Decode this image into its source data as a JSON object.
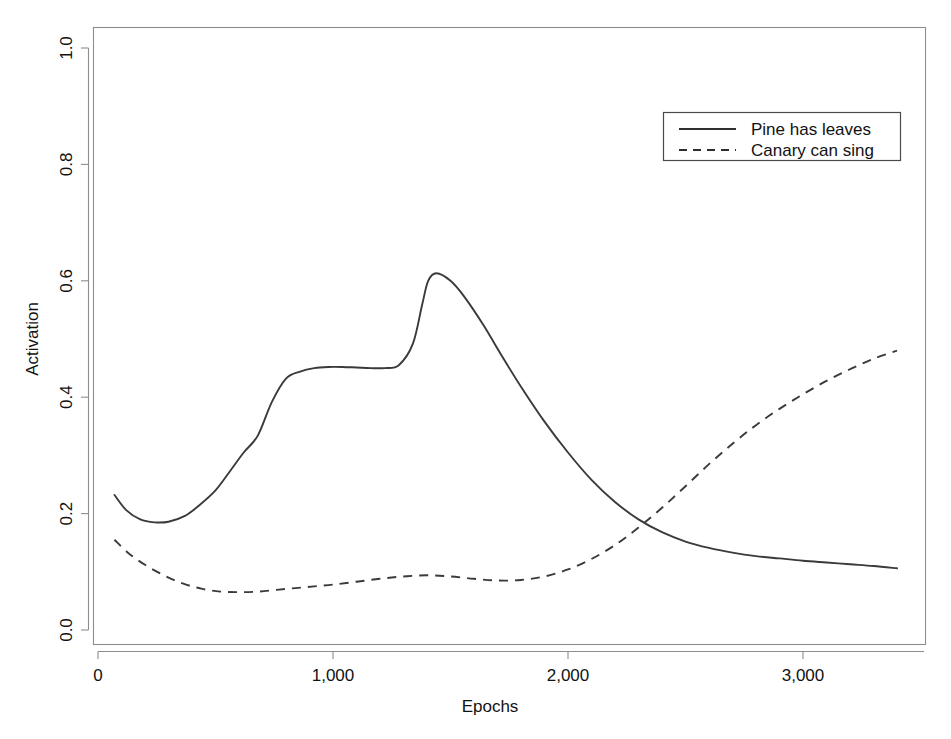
{
  "chart_data": {
    "type": "line",
    "title": "",
    "xlabel": "Epochs",
    "ylabel": "Activation",
    "xlim": [
      0,
      3400
    ],
    "ylim": [
      0.0,
      1.05
    ],
    "xticks": [
      0,
      1000,
      2000,
      3000
    ],
    "xticklabels": [
      "0",
      "1,000",
      "2,000",
      "3,000"
    ],
    "yticks": [
      0.0,
      0.2,
      0.4,
      0.6,
      0.8,
      1.0
    ],
    "yticklabels": [
      "0.0",
      "0.2",
      "0.4",
      "0.6",
      "0.8",
      "1.0"
    ],
    "grid": false,
    "legend_position": "upper right",
    "series": [
      {
        "name": "Pine has leaves",
        "style": "solid",
        "color": "#3a3a3a",
        "x": [
          70,
          120,
          180,
          240,
          300,
          370,
          430,
          500,
          560,
          620,
          680,
          740,
          800,
          860,
          920,
          980,
          1040,
          1100,
          1160,
          1220,
          1280,
          1340,
          1380,
          1405,
          1440,
          1500,
          1560,
          1640,
          1720,
          1800,
          1900,
          2000,
          2100,
          2200,
          2300,
          2400,
          2500,
          2600,
          2700,
          2800,
          2900,
          3000,
          3100,
          3200,
          3300,
          3400
        ],
        "y": [
          0.232,
          0.206,
          0.19,
          0.185,
          0.186,
          0.196,
          0.214,
          0.24,
          0.272,
          0.305,
          0.334,
          0.392,
          0.432,
          0.444,
          0.45,
          0.452,
          0.452,
          0.451,
          0.45,
          0.45,
          0.455,
          0.492,
          0.56,
          0.6,
          0.613,
          0.6,
          0.572,
          0.524,
          0.47,
          0.418,
          0.358,
          0.305,
          0.258,
          0.22,
          0.19,
          0.168,
          0.152,
          0.141,
          0.133,
          0.127,
          0.123,
          0.119,
          0.116,
          0.113,
          0.11,
          0.106
        ]
      },
      {
        "name": "Canary can sing",
        "style": "dashed",
        "color": "#3a3a3a",
        "x": [
          70,
          130,
          200,
          280,
          360,
          440,
          520,
          600,
          680,
          760,
          840,
          920,
          1000,
          1100,
          1200,
          1300,
          1400,
          1500,
          1600,
          1700,
          1800,
          1900,
          2000,
          2100,
          2200,
          2300,
          2400,
          2500,
          2600,
          2700,
          2800,
          2900,
          3000,
          3100,
          3200,
          3300,
          3400
        ],
        "y": [
          0.155,
          0.132,
          0.112,
          0.094,
          0.08,
          0.071,
          0.066,
          0.065,
          0.066,
          0.069,
          0.072,
          0.075,
          0.078,
          0.083,
          0.088,
          0.092,
          0.094,
          0.092,
          0.088,
          0.085,
          0.086,
          0.092,
          0.104,
          0.122,
          0.146,
          0.176,
          0.21,
          0.247,
          0.285,
          0.32,
          0.352,
          0.38,
          0.405,
          0.428,
          0.448,
          0.466,
          0.48
        ]
      }
    ],
    "annotations": {
      "crossover_epoch": 2250,
      "crossover_activation": 0.178,
      "solid_peak_epoch": 1405,
      "solid_peak_activation": 0.613,
      "dashed_min_epoch": 600,
      "dashed_min_activation": 0.065
    }
  },
  "axes": {
    "x_title": "Epochs",
    "y_title": "Activation"
  },
  "legend": {
    "entries": [
      {
        "label": "Pine has leaves",
        "style": "solid"
      },
      {
        "label": "Canary can sing",
        "style": "dashed"
      }
    ]
  }
}
